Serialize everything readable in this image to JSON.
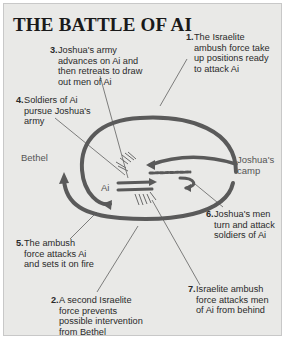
{
  "title": "THE BATTLE OF AI",
  "colors": {
    "background": "#e9e9e7",
    "border": "#c8c8c8",
    "route_line": "#5a5a5a",
    "leader_line": "#333333",
    "text": "#2a2a2a",
    "place_text": "#555555"
  },
  "places": {
    "bethel": "Bethel",
    "ai": "Ai",
    "joshuas_camp": "Joshua's camp"
  },
  "steps": [
    {
      "num": "1.",
      "text": "The Israelite ambush force take up positions ready to attack Ai"
    },
    {
      "num": "2.",
      "text": "A second Israelite force prevents possible intervention from Bethel"
    },
    {
      "num": "3.",
      "text": "Joshua's army advances on Ai and then retreats to draw out men of Ai"
    },
    {
      "num": "4.",
      "text": "Soldiers of Ai pursue Joshua's army"
    },
    {
      "num": "5.",
      "text": "The ambush force attacks Ai and sets it on fire"
    },
    {
      "num": "6.",
      "text": "Joshua's men turn and attack soldiers of Ai"
    },
    {
      "num": "7.",
      "text": "Israelite ambush force attacks men of Ai from behind"
    }
  ]
}
